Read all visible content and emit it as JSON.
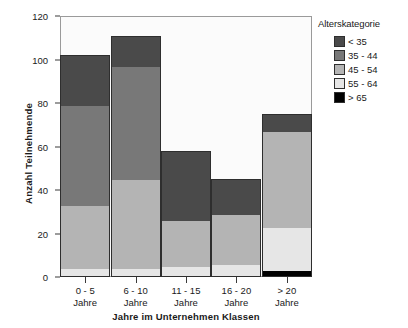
{
  "chart_data": {
    "type": "bar",
    "stacked": true,
    "title": "",
    "xlabel": "Jahre im Unternehmen Klassen",
    "ylabel": "Anzahl Teilnehmende",
    "categories": [
      "0 - 5 Jahre",
      "6 - 10 Jahre",
      "11 - 15 Jahre",
      "16 - 20 Jahre",
      "> 20 Jahre"
    ],
    "category_lines": [
      [
        "0 - 5",
        "Jahre"
      ],
      [
        "6 - 10",
        "Jahre"
      ],
      [
        "11 - 15",
        "Jahre"
      ],
      [
        "16 - 20",
        "Jahre"
      ],
      [
        "> 20",
        "Jahre"
      ]
    ],
    "ylim": [
      0,
      120
    ],
    "yticks": [
      0,
      20,
      40,
      60,
      80,
      100,
      120
    ],
    "grid": false,
    "legend_position": "right",
    "legend_title": "Alterskategorie",
    "series": [
      {
        "name": "> 65",
        "color": "#000000",
        "values": [
          0,
          0,
          0,
          0,
          3
        ]
      },
      {
        "name": "55 - 64",
        "color": "#e6e6e6",
        "values": [
          4,
          4,
          5,
          6,
          20
        ]
      },
      {
        "name": "45 - 54",
        "color": "#b4b4b4",
        "values": [
          29,
          41,
          21,
          23,
          44
        ]
      },
      {
        "name": "35 - 44",
        "color": "#787878",
        "values": [
          46,
          52,
          0,
          0,
          0
        ]
      },
      {
        "name": "< 35",
        "color": "#4a4a4a",
        "values": [
          23,
          14,
          32,
          16,
          8
        ]
      }
    ],
    "totals": [
      102,
      111,
      58,
      45,
      75
    ],
    "stack_order_bottom_to_top": [
      "> 65",
      "55 - 64",
      "45 - 54",
      "35 - 44",
      "< 35"
    ]
  },
  "legend": {
    "title": "Alterskategorie",
    "items": [
      {
        "label": "< 35",
        "color": "#4a4a4a"
      },
      {
        "label": "35 - 44",
        "color": "#787878"
      },
      {
        "label": "45 - 54",
        "color": "#b4b4b4"
      },
      {
        "label": "55 - 64",
        "color": "#e6e6e6"
      },
      {
        "label": "> 65",
        "color": "#000000"
      }
    ]
  },
  "axes": {
    "y_title": "Anzahl Teilnehmende",
    "x_title": "Jahre im Unternehmen Klassen",
    "y_tick_labels": [
      "0",
      "20",
      "40",
      "60",
      "80",
      "100",
      "120"
    ]
  }
}
